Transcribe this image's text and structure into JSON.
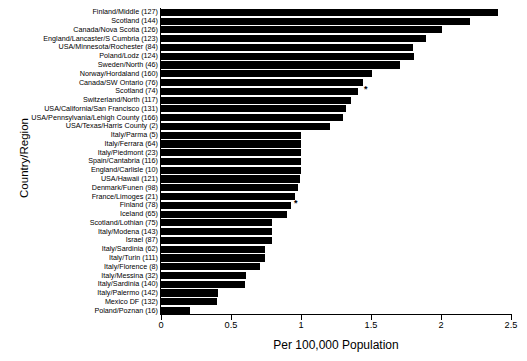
{
  "chart_data": {
    "type": "bar",
    "orientation": "horizontal",
    "title": "",
    "xlabel": "Per 100,000 Population",
    "ylabel": "Country/Region",
    "xlim": [
      0,
      2.5
    ],
    "xticks": [
      0,
      0.5,
      1,
      1.5,
      2,
      2.5
    ],
    "xtick_labels": [
      "0",
      "0.5",
      "1",
      "1.5",
      "2",
      "2.5"
    ],
    "grid": false,
    "legend": "none",
    "bar_color": "#000000",
    "annotation_marker": "*",
    "categories": [
      "Finland/Middle (127)",
      "Scotland (144)",
      "Canada/Nova Scotia (126)",
      "England/Lancaster/S Cumbria (123)",
      "USA/Minnesota/Rochester (84)",
      "Poland/Lodz (124)",
      "Sweden/North (46)",
      "Norway/Hordaland (160)",
      "Canada/SW Ontario (76)",
      "Scotland (74)",
      "Switzerland/North (117)",
      "USA/California/San Francisco (131)",
      "USA/Pennsylvania/Lehigh County (166)",
      "USA/Texas/Harris County (2)",
      "Italy/Parma (5)",
      "Italy/Ferrara (64)",
      "Italy/Piedmont (23)",
      "Spain/Cantabria (116)",
      "England/Carlisle (10)",
      "USA/Hawaii (121)",
      "Denmark/Funen (98)",
      "France/Limoges (21)",
      "Finland (78)",
      "Iceland (65)",
      "Scotland/Lothian (75)",
      "Italy/Modena (143)",
      "Israel (87)",
      "Italy/Sardinia (62)",
      "Italy/Turin (111)",
      "Italy/Florence (8)",
      "Italy/Messina (32)",
      "Italy/Sardinia (140)",
      "Italy/Palermo (142)",
      "Mexico DF (132)",
      "Poland/Poznan (16)"
    ],
    "values": [
      2.41,
      2.21,
      2.01,
      1.89,
      1.8,
      1.81,
      1.71,
      1.51,
      1.44,
      1.41,
      1.36,
      1.32,
      1.3,
      1.21,
      1.0,
      1.0,
      1.0,
      1.0,
      1.0,
      0.99,
      0.98,
      0.96,
      0.93,
      0.9,
      0.79,
      0.79,
      0.79,
      0.74,
      0.74,
      0.71,
      0.61,
      0.6,
      0.41,
      0.4,
      0.21
    ],
    "starred_categories": [
      "Scotland (74)",
      "Finland (78)"
    ],
    "star_values": [
      1.45,
      0.95
    ]
  }
}
